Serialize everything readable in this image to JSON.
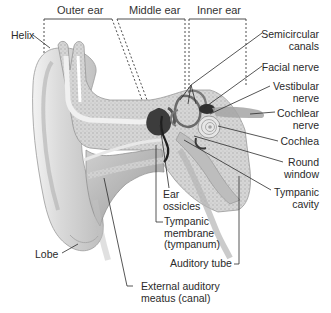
{
  "diagram": {
    "sections": [
      {
        "label": "Outer ear"
      },
      {
        "label": "Middle ear"
      },
      {
        "label": "Inner ear"
      }
    ],
    "labels": {
      "helix": "Helix",
      "semicircular_1": "Semicircular",
      "semicircular_2": "canals",
      "facial_nerve": "Facial nerve",
      "vestibular_1": "Vestibular",
      "vestibular_2": "nerve",
      "cochlear_nerve_1": "Cochlear",
      "cochlear_nerve_2": "nerve",
      "cochlea": "Cochlea",
      "round_window_1": "Round",
      "round_window_2": "window",
      "tympanic_cavity_1": "Tympanic",
      "tympanic_cavity_2": "cavity",
      "ear_ossicles_1": "Ear",
      "ear_ossicles_2": "ossicles",
      "tympanic_membrane_1": "Tympanic",
      "tympanic_membrane_2": "membrane",
      "tympanic_membrane_3": "(tympanum)",
      "auditory_tube": "Auditory tube",
      "lobe": "Lobe",
      "eam_1": "External auditory",
      "eam_2": "meatus (canal)"
    },
    "colors": {
      "line": "#2b2b2b",
      "text": "#2a2a2a",
      "skin_light": "#e6e6e6",
      "skin_mid": "#c8c8c8",
      "bone": "#d4d4d4",
      "dark": "#3a3a3a"
    }
  }
}
